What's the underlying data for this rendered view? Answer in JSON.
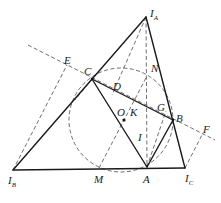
{
  "diagram": {
    "points": {
      "IA": {
        "label": "I",
        "sub": "A",
        "x": 146,
        "y": 17
      },
      "IB": {
        "label": "I",
        "sub": "B",
        "x": 13,
        "y": 170
      },
      "IC": {
        "label": "I",
        "sub": "C",
        "x": 185,
        "y": 168
      },
      "A": {
        "label": "A",
        "x": 147,
        "y": 167
      },
      "B": {
        "label": "B",
        "x": 173,
        "y": 120
      },
      "C": {
        "label": "C",
        "x": 92,
        "y": 79
      },
      "D": {
        "label": "D",
        "x": 117,
        "y": 91
      },
      "E": {
        "label": "E",
        "x": 67,
        "y": 65
      },
      "F": {
        "label": "F",
        "x": 203,
        "y": 133
      },
      "G": {
        "label": "G",
        "x": 162,
        "y": 108
      },
      "I": {
        "label": "I",
        "x": 147,
        "y": 130
      },
      "K": {
        "label": "K",
        "x": 133,
        "y": 112
      },
      "M": {
        "label": "M",
        "x": 99,
        "y": 168
      },
      "N": {
        "label": "N",
        "x": 147,
        "y": 76
      },
      "O": {
        "label": "O",
        "x": 124,
        "y": 119
      }
    },
    "circle": {
      "cx": 121,
      "cy": 120,
      "r": 52,
      "style": "dashed"
    },
    "labels": [
      "I_A",
      "I_B",
      "I_C",
      "A",
      "B",
      "C",
      "D",
      "E",
      "F",
      "G",
      "I",
      "K",
      "M",
      "N",
      "O"
    ]
  }
}
